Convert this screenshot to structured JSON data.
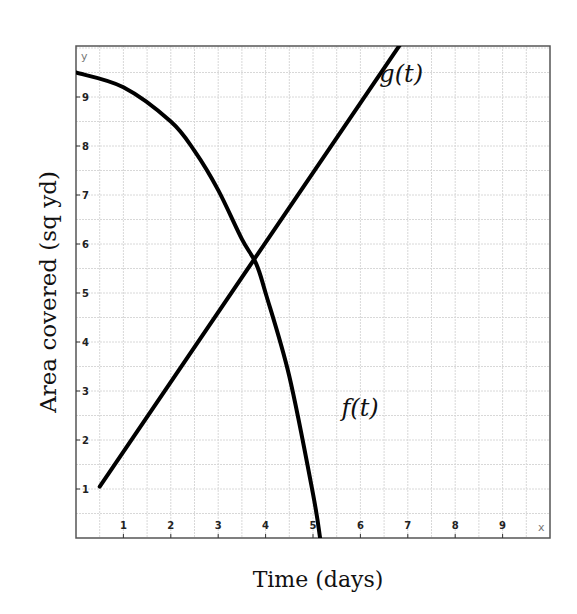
{
  "chart_data": {
    "type": "line",
    "title": "",
    "xlabel": "Time (days)",
    "ylabel": "Area covered (sq yd)",
    "x_axis_letter": "x",
    "y_axis_letter": "y",
    "xlim": [
      0,
      10
    ],
    "ylim": [
      0,
      10
    ],
    "x_ticks": [
      1,
      2,
      3,
      4,
      5,
      6,
      7,
      8,
      9
    ],
    "y_ticks": [
      1,
      2,
      3,
      4,
      5,
      6,
      7,
      8,
      9
    ],
    "grid": true,
    "minor_grid_step": 0.5,
    "series": [
      {
        "name": "f(t)",
        "label": "f(t)",
        "shape": "concave-down decreasing curve",
        "points": [
          [
            0,
            9.5
          ],
          [
            1,
            9.2
          ],
          [
            2,
            8.5
          ],
          [
            2.5,
            7.9
          ],
          [
            3,
            7.1
          ],
          [
            3.5,
            6.1
          ],
          [
            3.8,
            5.6
          ],
          [
            4,
            5.0
          ],
          [
            4.5,
            3.3
          ],
          [
            5,
            0.9
          ],
          [
            5.15,
            0
          ]
        ],
        "label_position": [
          5.6,
          2.5
        ]
      },
      {
        "name": "g(t)",
        "label": "g(t)",
        "shape": "straight increasing line",
        "points": [
          [
            0.5,
            1.05
          ],
          [
            3.8,
            5.6
          ],
          [
            7,
            10.3
          ]
        ],
        "label_position": [
          6.4,
          9.3
        ]
      }
    ],
    "intersection": [
      3.8,
      5.6
    ]
  }
}
